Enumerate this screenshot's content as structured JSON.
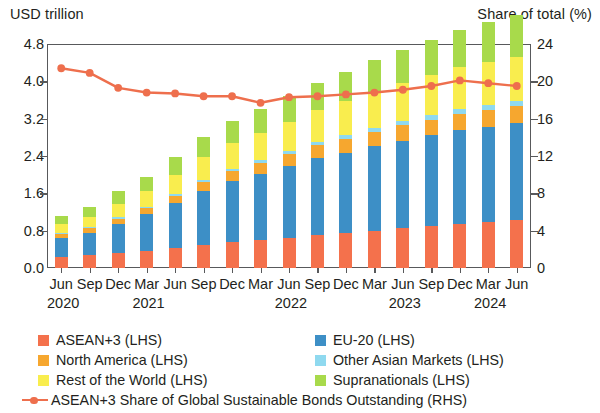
{
  "axes": {
    "lhs_title": "USD trillion",
    "rhs_title": "Share of total (%)",
    "lhs_ticks": [
      "4.8",
      "4.0",
      "3.2",
      "2.4",
      "1.6",
      "0.8",
      "0.0"
    ],
    "rhs_ticks": [
      "24",
      "20",
      "16",
      "12",
      "8",
      "4",
      "0"
    ]
  },
  "legend": {
    "items": [
      {
        "label": "ASEAN+3 (LHS)",
        "color": "#f4714c",
        "type": "swatch"
      },
      {
        "label": "EU-20 (LHS)",
        "color": "#3d8fc6",
        "type": "swatch"
      },
      {
        "label": "North America (LHS)",
        "color": "#f6a72f",
        "type": "swatch"
      },
      {
        "label": "Other Asian Markets (LHS)",
        "color": "#8fd9ef",
        "type": "swatch"
      },
      {
        "label": "Rest of the World (LHS)",
        "color": "#f9ed4e",
        "type": "swatch"
      },
      {
        "label": "Supranationals (LHS)",
        "color": "#a8da4b",
        "type": "swatch"
      },
      {
        "label": "ASEAN+3 Share of Global Sustainable Bonds Outstanding (RHS)",
        "color": "#ee6f4d",
        "type": "line"
      }
    ]
  },
  "chart_data": {
    "type": "bar",
    "subtype": "stacked-bar-with-line",
    "title": "",
    "xlabel": "",
    "ylabel": "USD trillion",
    "y2label": "Share of total (%)",
    "ylim": [
      0,
      4.8
    ],
    "y2lim": [
      0,
      24
    ],
    "grid": false,
    "legend_position": "bottom",
    "categories": [
      "Jun 2020",
      "Sep 2020",
      "Dec 2020",
      "Mar 2021",
      "Jun 2021",
      "Sep 2021",
      "Dec 2021",
      "Mar 2022",
      "Jun 2022",
      "Sep 2022",
      "Dec 2022",
      "Mar 2023",
      "Jun 2023",
      "Sep 2023",
      "Dec 2023",
      "Mar 2024",
      "Jun 2024"
    ],
    "x_month_labels": [
      "Jun",
      "Sep",
      "Dec",
      "Mar",
      "Jun",
      "Sep",
      "Dec",
      "Mar",
      "Jun",
      "Sep",
      "Dec",
      "Mar",
      "Jun",
      "Sep",
      "Dec",
      "Mar",
      "Jun"
    ],
    "x_year_labels": [
      {
        "text": "2020",
        "index": 0
      },
      {
        "text": "2021",
        "index": 3
      },
      {
        "text": "2022",
        "index": 8
      },
      {
        "text": "2023",
        "index": 12
      },
      {
        "text": "2024",
        "index": 15
      }
    ],
    "series": [
      {
        "name": "ASEAN+3 (LHS)",
        "axis": "left",
        "color": "#f4714c",
        "values": [
          0.24,
          0.27,
          0.32,
          0.37,
          0.43,
          0.5,
          0.56,
          0.6,
          0.65,
          0.7,
          0.74,
          0.79,
          0.85,
          0.89,
          0.95,
          0.98,
          1.03
        ]
      },
      {
        "name": "EU-20 (LHS)",
        "axis": "left",
        "color": "#3d8fc6",
        "values": [
          0.4,
          0.49,
          0.63,
          0.78,
          0.96,
          1.15,
          1.3,
          1.42,
          1.53,
          1.65,
          1.73,
          1.82,
          1.88,
          1.95,
          2.01,
          2.05,
          2.08
        ]
      },
      {
        "name": "North America (LHS)",
        "axis": "left",
        "color": "#f6a72f",
        "values": [
          0.08,
          0.09,
          0.11,
          0.13,
          0.16,
          0.19,
          0.22,
          0.24,
          0.26,
          0.28,
          0.3,
          0.31,
          0.33,
          0.34,
          0.35,
          0.36,
          0.36
        ]
      },
      {
        "name": "Other Asian Markets (LHS)",
        "axis": "left",
        "color": "#8fd9ef",
        "values": [
          0.02,
          0.02,
          0.03,
          0.03,
          0.04,
          0.05,
          0.05,
          0.06,
          0.06,
          0.07,
          0.07,
          0.08,
          0.08,
          0.09,
          0.09,
          0.1,
          0.1
        ]
      },
      {
        "name": "Rest of the World (LHS)",
        "axis": "left",
        "color": "#f9ed4e",
        "values": [
          0.2,
          0.23,
          0.29,
          0.34,
          0.41,
          0.48,
          0.54,
          0.58,
          0.63,
          0.68,
          0.73,
          0.78,
          0.82,
          0.86,
          0.9,
          0.93,
          0.96
        ]
      },
      {
        "name": "Supranationals (LHS)",
        "axis": "left",
        "color": "#a8da4b",
        "values": [
          0.18,
          0.21,
          0.26,
          0.31,
          0.37,
          0.43,
          0.48,
          0.51,
          0.55,
          0.59,
          0.63,
          0.67,
          0.71,
          0.75,
          0.8,
          0.85,
          0.9
        ]
      },
      {
        "name": "ASEAN+3 Share of Global Sustainable Bonds Outstanding (RHS)",
        "axis": "right",
        "color": "#ee6f4d",
        "type": "line",
        "values": [
          21.4,
          20.9,
          19.3,
          18.8,
          18.7,
          18.4,
          18.4,
          17.7,
          18.3,
          18.4,
          18.6,
          18.8,
          19.1,
          19.5,
          20.1,
          19.8,
          19.5
        ]
      }
    ],
    "bar_totals": [
      1.12,
      1.31,
      1.64,
      1.96,
      2.37,
      2.8,
      3.15,
      3.41,
      3.68,
      3.97,
      4.2,
      4.45,
      4.67,
      4.88,
      5.1,
      5.27,
      5.43
    ]
  }
}
